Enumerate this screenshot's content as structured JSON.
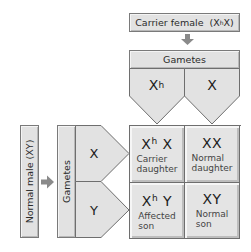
{
  "female_parent": {
    "label": "Carrier female",
    "genotype_prefix": "(X",
    "genotype_sup": "h",
    "genotype_suffix": " X)"
  },
  "female_gametes": {
    "header": "Gametes",
    "items": [
      {
        "base": "X",
        "sup": "h"
      },
      {
        "base": "X",
        "sup": ""
      }
    ]
  },
  "male_parent": {
    "label": "Normal male  (XY)"
  },
  "male_gametes": {
    "header": "Gametes",
    "items": [
      {
        "base": "X",
        "sup": ""
      },
      {
        "base": "Y",
        "sup": ""
      }
    ]
  },
  "offspring": [
    {
      "geno_base1": "X",
      "geno_sup": "h",
      "geno_rest": " X",
      "line1": "Carrier",
      "line2": "daughter"
    },
    {
      "geno_base1": "XX",
      "geno_sup": "",
      "geno_rest": "",
      "line1": "Normal",
      "line2": "daughter"
    },
    {
      "geno_base1": "X",
      "geno_sup": "h",
      "geno_rest": " Y",
      "line1": "Affected",
      "line2": "son"
    },
    {
      "geno_base1": "XY",
      "geno_sup": "",
      "geno_rest": "",
      "line1": "Normal",
      "line2": "son"
    }
  ],
  "colors": {
    "box_fill": "#e2e2e2",
    "border": "#6e6e6e",
    "arrow": "#8a8a8a"
  },
  "icons": {
    "down_arrow": "arrow-down-icon",
    "right_arrow": "arrow-right-icon"
  }
}
